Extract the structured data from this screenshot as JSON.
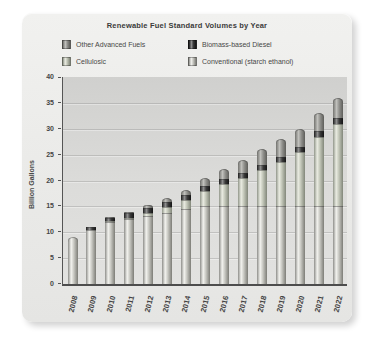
{
  "page": {
    "background": "#ffffff",
    "card_background": "#ebebea"
  },
  "chart_data": {
    "type": "bar",
    "stacked": true,
    "title": "Renewable Fuel Standard Volumes by Year",
    "xlabel": "",
    "ylabel": "Billion Gallons",
    "ylim": [
      0,
      40
    ],
    "ytick_step": 5,
    "grid": "horizontal",
    "legend_position": "top",
    "categories": [
      "2008",
      "2009",
      "2010",
      "2011",
      "2012",
      "2013",
      "2014",
      "2015",
      "2016",
      "2017",
      "2018",
      "2019",
      "2020",
      "2021",
      "2022"
    ],
    "series": [
      {
        "key": "conventional",
        "name": "Conventional (starch ethanol)",
        "color": "#c9c9c3",
        "values": [
          9.0,
          10.5,
          12.0,
          12.6,
          13.2,
          13.8,
          14.4,
          15.0,
          15.0,
          15.0,
          15.0,
          15.0,
          15.0,
          15.0,
          15.0
        ]
      },
      {
        "key": "cellulosic",
        "name": "Cellulosic",
        "color": "#c4c8ba",
        "values": [
          0,
          0,
          0.1,
          0.25,
          0.5,
          1.0,
          1.75,
          3.0,
          4.25,
          5.5,
          7.0,
          8.5,
          10.5,
          13.5,
          16.0
        ]
      },
      {
        "key": "bbd",
        "name": "Biomass-based Diesel",
        "color": "#2a2a2a",
        "values": [
          0,
          0.5,
          0.65,
          0.8,
          1.0,
          1.0,
          1.0,
          1.0,
          1.0,
          1.0,
          1.0,
          1.0,
          1.0,
          1.0,
          1.0
        ]
      },
      {
        "key": "other",
        "name": "Other Advanced Fuels",
        "color": "#8f8f8b",
        "values": [
          0,
          0.1,
          0.2,
          0.3,
          0.5,
          0.75,
          1.0,
          1.5,
          2.0,
          2.5,
          3.0,
          3.5,
          3.5,
          3.5,
          4.0
        ]
      }
    ],
    "totals": [
      9.0,
      11.1,
      12.95,
      13.95,
      15.2,
      16.55,
      18.15,
      20.5,
      22.25,
      24.0,
      26.0,
      28.0,
      30.0,
      33.0,
      36.0
    ],
    "legend": [
      {
        "label": "Other Advanced Fuels",
        "series_key": "other"
      },
      {
        "label": "Biomass-based Diesel",
        "series_key": "bbd"
      },
      {
        "label": "Cellulosic",
        "series_key": "cellulosic"
      },
      {
        "label": "Conventional (starch ethanol)",
        "series_key": "conventional"
      }
    ]
  }
}
